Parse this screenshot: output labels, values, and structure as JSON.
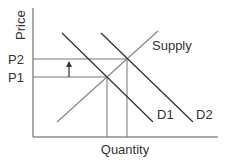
{
  "diagram": {
    "axes": {
      "x_label": "Quantity",
      "y_label": "Price"
    },
    "price_levels": [
      {
        "label": "P2",
        "y": 59
      },
      {
        "label": "P1",
        "y": 77
      }
    ],
    "curves": [
      {
        "label": "Supply",
        "color": "#8a8a8a"
      },
      {
        "label": "D1",
        "color": "#333333"
      },
      {
        "label": "D2",
        "color": "#333333"
      }
    ],
    "annotations": {
      "arrow": "up-arrow from P1 to P2"
    }
  }
}
